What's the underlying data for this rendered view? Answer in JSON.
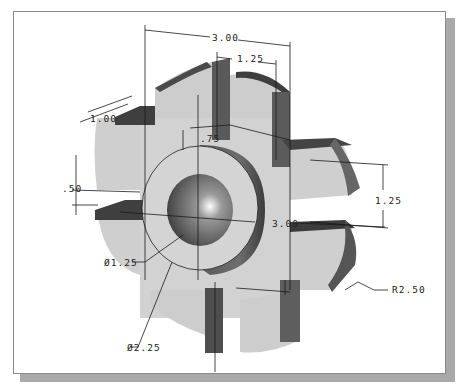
{
  "figure": {
    "type": "cad-isometric-part-drawing",
    "colors": {
      "background": "#ffffff",
      "frame_border": "#8a8a8a",
      "frame_shadow": "#a9a9a9",
      "face_light": "#cfcfcf",
      "face_dark": "#4a4a4a",
      "face_mid": "#7a7a7a",
      "dimension_line": "#1a1a1a"
    }
  },
  "dimensions": {
    "overall_width": "3.00",
    "top_slot_offset": "1.25",
    "slot_depth": "1.00",
    "boss_offset": ".75",
    "slot_width": ".50",
    "inner_width": "3.00",
    "right_height": "1.25",
    "hole_diameter": "Ø1.25",
    "boss_diameter": "Ø2.25",
    "outer_radius": "R2.50"
  }
}
